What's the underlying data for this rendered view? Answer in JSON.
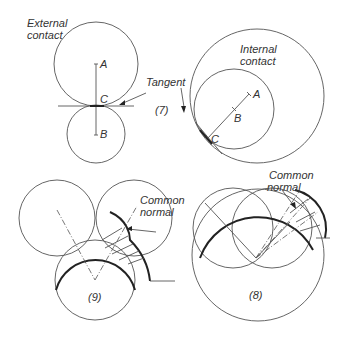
{
  "figures": {
    "fig7": {
      "number_label": "(7)",
      "external_label_line1": "External",
      "external_label_line2": "contact",
      "internal_label_line1": "Internal",
      "internal_label_line2": "contact",
      "tangent_label": "Tangent",
      "points": {
        "a": "A",
        "b": "B",
        "c": "C"
      }
    },
    "fig9": {
      "number_label": "(9)",
      "common_normal_line1": "Common",
      "common_normal_line2": "normal"
    },
    "fig8": {
      "number_label": "(8)",
      "common_normal_line1": "Common",
      "common_normal_line2": "normal"
    }
  },
  "colors": {
    "line": "#555555",
    "thick": "#222222",
    "text": "#333333"
  }
}
